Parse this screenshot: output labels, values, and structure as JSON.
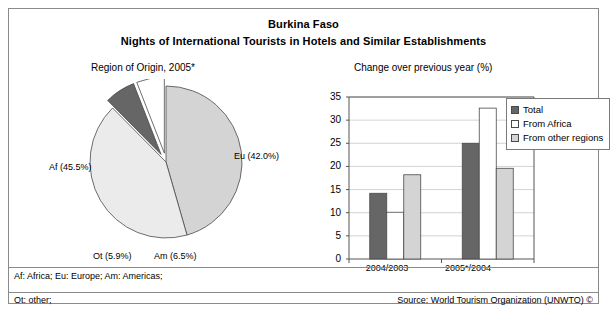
{
  "title": {
    "country": "Burkina Faso",
    "subject": "Nights of International Tourists in Hotels and Similar Establishments"
  },
  "pie_panel": {
    "caption": "Region of Origin, 2005*"
  },
  "bar_panel": {
    "caption": "Change over previous year (%)"
  },
  "footnotes": {
    "abbreviations": "Af: Africa; Eu: Europe; Am: Americas;",
    "other": "Ot: other;",
    "source": "Source: World Tourism Organization (UNWTO) ©"
  },
  "colors": {
    "dark_gray": "#666666",
    "light_gray": "#d4d4d4",
    "pale_gray": "#ebebeb",
    "white": "#ffffff",
    "outline": "#4a4a4a",
    "grid": "#c8c8c8",
    "axis": "#555555"
  },
  "chart_data": [
    {
      "type": "pie",
      "title": "Region of Origin, 2005*",
      "categories": [
        "Af",
        "Eu",
        "Am",
        "Ot"
      ],
      "labels": [
        "Af (45.5%)",
        "Eu (42.0%)",
        "Am (6.5%)",
        "Ot (5.9%)"
      ],
      "values": [
        45.5,
        42.0,
        6.5,
        5.9
      ],
      "units": "percent",
      "legend": "none",
      "slice_colors": [
        "#d4d4d4",
        "#ebebeb",
        "#666666",
        "#ffffff"
      ],
      "exploded": [
        "Am",
        "Ot"
      ],
      "start_angle_deg": -90,
      "direction": "clockwise"
    },
    {
      "type": "bar",
      "title": "Change over previous year (%)",
      "categories": [
        "2004/2003",
        "2005*/2004"
      ],
      "xlabel": "",
      "ylabel": "",
      "ylim": [
        0,
        35
      ],
      "yticks": [
        0,
        5,
        10,
        15,
        20,
        25,
        30,
        35
      ],
      "grid": true,
      "legend_position": "right",
      "series": [
        {
          "name": "Total",
          "values": [
            14.2,
            25.0
          ],
          "color": "#666666"
        },
        {
          "name": "From Africa",
          "values": [
            10.1,
            32.6
          ],
          "color": "#ffffff"
        },
        {
          "name": "From other regions",
          "values": [
            18.2,
            19.6
          ],
          "color": "#d4d4d4"
        }
      ]
    }
  ]
}
